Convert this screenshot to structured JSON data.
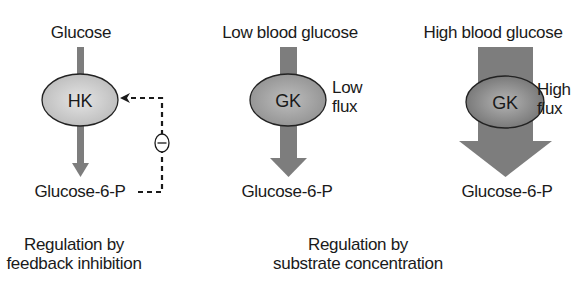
{
  "panels": [
    {
      "id": "feedback",
      "substrate": "Glucose",
      "enzyme": "HK",
      "product": "Glucose-6-P",
      "inhibition_symbol": "−"
    },
    {
      "id": "low",
      "substrate": "Low blood glucose",
      "enzyme": "GK",
      "flux_line1": "Low",
      "flux_line2": "flux",
      "product": "Glucose-6-P"
    },
    {
      "id": "high",
      "substrate": "High blood glucose",
      "enzyme": "GK",
      "flux_line1": "High",
      "flux_line2": "flux",
      "product": "Glucose-6-P"
    }
  ],
  "captions": [
    {
      "line1": "Regulation by",
      "line2": "feedback inhibition"
    },
    {
      "line1": "Regulation by",
      "line2": "substrate concentration"
    }
  ],
  "colors": {
    "arrow": "#7d7d7d",
    "enzyme_light": "#d4d4d4",
    "enzyme_dark": "#8a8a8a",
    "text": "#1a1a1a"
  }
}
